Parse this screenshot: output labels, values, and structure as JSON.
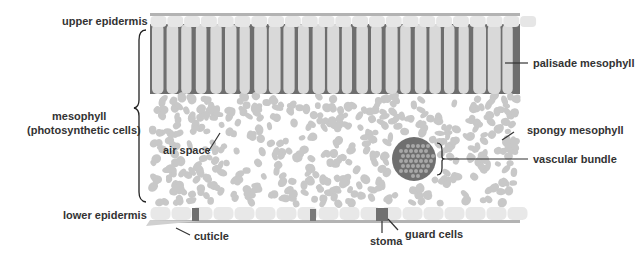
{
  "labels": {
    "upper_epidermis": "upper epidermis",
    "mesophyll": "mesophyll",
    "mesophyll_sub": "(photosynthetic cells)",
    "air_space": "air space",
    "lower_epidermis": "lower epidermis",
    "cuticle": "cuticle",
    "stoma": "stoma",
    "guard_cells": "guard cells",
    "palisade_mesophyll": "palisade mesophyll",
    "spongy_mesophyll": "spongy mesophyll",
    "vascular_bundle": "vascular bundle"
  },
  "colors": {
    "cuticle": "#b3b3b3",
    "epidermis": "#e6e6e6",
    "palisade_cell": "#d9d9d9",
    "palisade_gap": "#6e6e6e",
    "spongy_cell": "#c8c8c8",
    "vascular_bundle": "#6f6f6f",
    "guard_cell": "#777777",
    "label_text": "#333333"
  }
}
